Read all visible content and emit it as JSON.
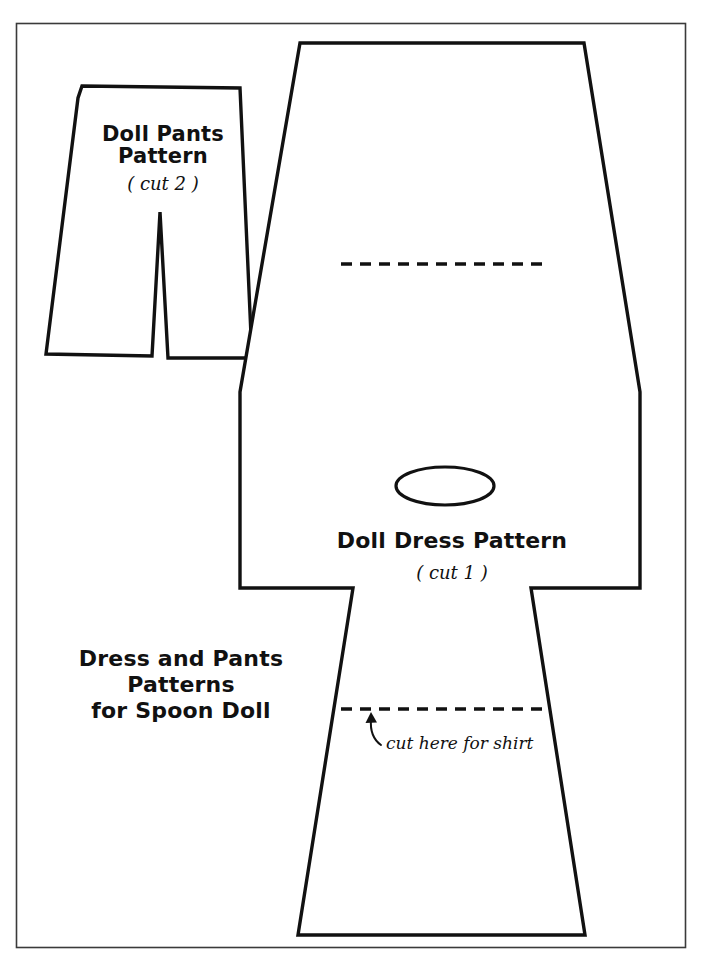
{
  "document": {
    "type": "sewing-pattern-sheet",
    "title": "Dress and Pants Patterns for Spoon Doll",
    "background_color": "#ffffff",
    "ink_color": "#111111",
    "border": {
      "color": "#333333",
      "x": 16,
      "y": 23,
      "width": 670,
      "height": 925
    }
  },
  "labels": {
    "pants_title_line1": "Doll Pants",
    "pants_title_line2": "Pattern",
    "pants_cut": "( cut 2 )",
    "dress_title": "Doll Dress Pattern",
    "dress_cut": "( cut 1 )",
    "sheet_caption_line1": "Dress and Pants",
    "sheet_caption_line2": "Patterns",
    "sheet_caption_line3": "for Spoon Doll",
    "cut_here_annotation": "cut here for shirt"
  },
  "shapes": {
    "pants": {
      "name": "Doll Pants Pattern",
      "cut_quantity": 2,
      "outline_points": "82,86 240,88 252,358 168,358 160,212 152,356 46,354 78,98",
      "waist_top_y": 86,
      "hem_y": 357,
      "crotch_apex": {
        "x": 160,
        "y": 212
      }
    },
    "dress": {
      "name": "Doll Dress Pattern",
      "cut_quantity": 1,
      "outline_points": "300,43 584,43 640,392 640,588 531,588 585,935 298,935 353,588 240,588 240,392",
      "top_y": 43,
      "hem_y": 935,
      "sleeve_top_y": 392,
      "sleeve_bottom_y": 588,
      "neck_hole": {
        "cx": 445,
        "cy": 486,
        "rx": 49,
        "ry": 19
      }
    },
    "fold_lines": [
      {
        "name": "upper-dashed-fold-line",
        "x1": 341,
        "y1": 264,
        "x2": 545,
        "y2": 264
      },
      {
        "name": "lower-dashed-cut-line",
        "x1": 341,
        "y1": 709,
        "x2": 545,
        "y2": 709
      }
    ],
    "arrow": {
      "name": "cut-here-arrow",
      "path": "M 377,744 C 372,737 370,729 371,719",
      "head": "371,713 366,724 376,724"
    }
  }
}
